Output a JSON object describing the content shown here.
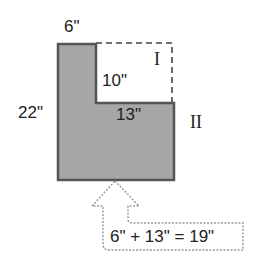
{
  "diagram": {
    "colors": {
      "fill": "#a6a6a6",
      "stroke": "#555555",
      "dashed": "#444444",
      "text": "#222222"
    },
    "labels": {
      "top_width": "6\"",
      "height": "22\"",
      "inner_height": "10\"",
      "inner_width": "13\"",
      "region_one": "I",
      "region_two": "II",
      "callout": "6\" + 13\" = 19\""
    }
  }
}
